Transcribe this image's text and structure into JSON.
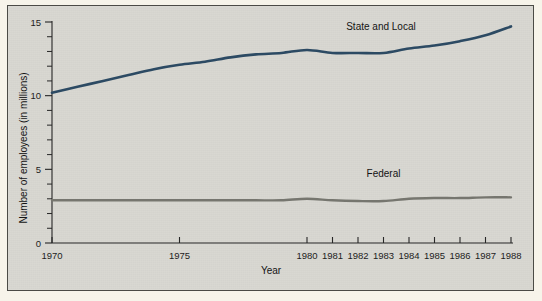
{
  "figure": {
    "background_color": "#f7f4ea",
    "panel_color": "#d9d8d2",
    "frame_color": "#4b4b46"
  },
  "chart_data": {
    "type": "line",
    "title": "",
    "subtitle": "",
    "xlabel": "Year",
    "ylabel": "Number of employees (in millions)",
    "xlim": [
      1970,
      1988
    ],
    "ylim": [
      0,
      15
    ],
    "grid": false,
    "legend_position": "inline-annotations",
    "y_ticks_major": [
      0,
      5,
      10,
      15
    ],
    "y_ticks_minor": [
      1,
      2,
      3,
      4,
      6,
      7,
      8,
      9,
      11,
      12,
      13,
      14
    ],
    "x_tick_labels": [
      "1970",
      "1975",
      "1980",
      "1981",
      "1982",
      "1983",
      "1984",
      "1985",
      "1986",
      "1987",
      "1988"
    ],
    "x_tick_values": [
      1970,
      1975,
      1980,
      1981,
      1982,
      1983,
      1984,
      1985,
      1986,
      1987,
      1988
    ],
    "x": [
      1970,
      1971,
      1972,
      1973,
      1974,
      1975,
      1976,
      1977,
      1978,
      1979,
      1980,
      1981,
      1982,
      1983,
      1984,
      1985,
      1986,
      1987,
      1988
    ],
    "series": [
      {
        "name": "State and Local",
        "color": "#2c4a63",
        "line_width": 2.6,
        "values": [
          10.2,
          10.6,
          11.0,
          11.4,
          11.8,
          12.1,
          12.3,
          12.6,
          12.8,
          12.9,
          13.1,
          12.9,
          12.9,
          12.9,
          13.2,
          13.4,
          13.7,
          14.1,
          14.7
        ]
      },
      {
        "name": "Federal",
        "color": "#76766f",
        "line_width": 2.4,
        "values": [
          2.9,
          2.9,
          2.9,
          2.9,
          2.9,
          2.9,
          2.9,
          2.9,
          2.9,
          2.9,
          3.0,
          2.9,
          2.85,
          2.85,
          3.0,
          3.05,
          3.05,
          3.1,
          3.1
        ]
      }
    ],
    "annotations": [
      {
        "text": "State and Local",
        "x": 1982.9,
        "y": 14.45
      },
      {
        "text": "Federal",
        "x": 1983.0,
        "y": 4.45
      }
    ]
  }
}
